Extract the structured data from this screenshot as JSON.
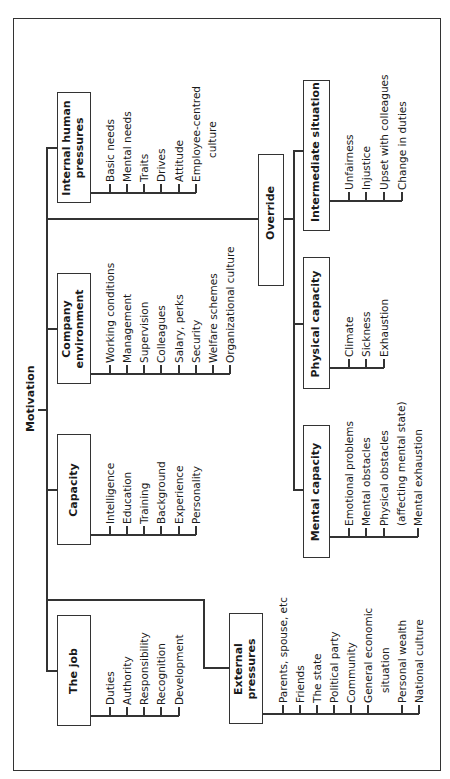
{
  "diagram": {
    "title": "Motivation",
    "orientation": "rotated-90-ccw",
    "branches": [
      {
        "id": "internal",
        "label_lines": [
          "Internal human",
          "pressures"
        ],
        "items": [
          "Basic needs",
          "Mental needs",
          "Traits",
          "Drives",
          "Attitude",
          "Employee-centred",
          "culture"
        ]
      },
      {
        "id": "company",
        "label_lines": [
          "Company",
          "environment"
        ],
        "items": [
          "Working conditions",
          "Management",
          "Supervision",
          "Colleagues",
          "Salary, perks",
          "Security",
          "Welfare schemes",
          "Organizational culture"
        ]
      },
      {
        "id": "capacity",
        "label_lines": [
          "Capacity"
        ],
        "items": [
          "Intelligence",
          "Education",
          "Training",
          "Background",
          "Experience",
          "Personality"
        ]
      },
      {
        "id": "job",
        "label_lines": [
          "The job"
        ],
        "items": [
          "Duties",
          "Authority",
          "Responsibility",
          "Recognition",
          "Development"
        ]
      },
      {
        "id": "external",
        "label_lines": [
          "External",
          "pressures"
        ],
        "items": [
          "Parents, spouse, etc",
          "Friends",
          "The state",
          "Political party",
          "Community",
          "General economic",
          "situation",
          "Personal wealth",
          "National culture"
        ]
      }
    ],
    "override": {
      "label": "Override",
      "branches": [
        {
          "id": "intermediate",
          "label": "Intermediate situation",
          "items": [
            "Unfairness",
            "Injustice",
            "Upset with colleagues",
            "Change in duties"
          ]
        },
        {
          "id": "physical",
          "label": "Physical capacity",
          "items": [
            "Climate",
            "Sickness",
            "Exhaustion"
          ]
        },
        {
          "id": "mental",
          "label": "Mental capacity",
          "items": [
            "Emotional problems",
            "Mental obstacles",
            "Physical obstacles",
            "(affecting mental state)",
            "Mental exhaustion"
          ]
        }
      ]
    }
  }
}
